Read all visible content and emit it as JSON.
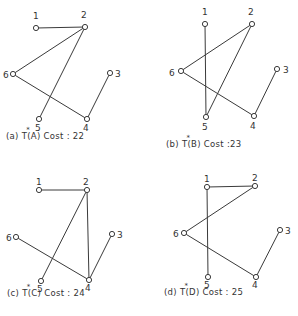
{
  "figure": {
    "panels": [
      {
        "id": "a",
        "caption": {
          "prefix": "(a)  T",
          "star": "*",
          "suffix": "(A)  Cost : 22",
          "x": 6,
          "y": 139,
          "tx": 36,
          "sx": 36
        },
        "nodes": [
          {
            "id": "1",
            "x": 36,
            "y": 28,
            "lx": 33,
            "ly": 19
          },
          {
            "id": "2",
            "x": 85,
            "y": 27,
            "lx": 81,
            "ly": 18
          },
          {
            "id": "3",
            "x": 110,
            "y": 73,
            "lx": 115,
            "ly": 77
          },
          {
            "id": "4",
            "x": 87,
            "y": 119,
            "lx": 83,
            "ly": 131
          },
          {
            "id": "5",
            "x": 39,
            "y": 119,
            "lx": 35,
            "ly": 131
          },
          {
            "id": "6",
            "x": 13,
            "y": 74,
            "lx": 3,
            "ly": 78
          }
        ],
        "edges": [
          [
            "1",
            "2"
          ],
          [
            "2",
            "6"
          ],
          [
            "2",
            "5"
          ],
          [
            "6",
            "4"
          ],
          [
            "4",
            "3"
          ]
        ]
      },
      {
        "id": "b",
        "caption": {
          "prefix": "(b)  T",
          "star": "*",
          "suffix": "(B)  Cost :23",
          "x": 166,
          "y": 147,
          "tx": 200,
          "sx": 200
        },
        "nodes": [
          {
            "id": "1",
            "x": 205,
            "y": 24,
            "lx": 202,
            "ly": 15
          },
          {
            "id": "2",
            "x": 252,
            "y": 24,
            "lx": 248,
            "ly": 15
          },
          {
            "id": "3",
            "x": 277,
            "y": 69,
            "lx": 283,
            "ly": 73
          },
          {
            "id": "4",
            "x": 254,
            "y": 116,
            "lx": 250,
            "ly": 129
          },
          {
            "id": "5",
            "x": 206,
            "y": 117,
            "lx": 202,
            "ly": 130
          },
          {
            "id": "6",
            "x": 181,
            "y": 71,
            "lx": 169,
            "ly": 76
          }
        ],
        "edges": [
          [
            "1",
            "5"
          ],
          [
            "2",
            "6"
          ],
          [
            "2",
            "5"
          ],
          [
            "6",
            "4"
          ],
          [
            "4",
            "3"
          ]
        ]
      },
      {
        "id": "c",
        "caption": {
          "prefix": "(c)  T",
          "star": "*",
          "suffix": "(C)  Cost : 24",
          "x": 7,
          "y": 296,
          "tx": 37,
          "sx": 37
        },
        "nodes": [
          {
            "id": "1",
            "x": 39,
            "y": 190,
            "lx": 36,
            "ly": 185
          },
          {
            "id": "2",
            "x": 87,
            "y": 190,
            "lx": 83,
            "ly": 185
          },
          {
            "id": "3",
            "x": 112,
            "y": 234,
            "lx": 117,
            "ly": 238
          },
          {
            "id": "4",
            "x": 89,
            "y": 280,
            "lx": 85,
            "ly": 291
          },
          {
            "id": "5",
            "x": 41,
            "y": 281,
            "lx": 37,
            "ly": 292
          },
          {
            "id": "6",
            "x": 16,
            "y": 237,
            "lx": 6,
            "ly": 241
          }
        ],
        "edges": [
          [
            "1",
            "2"
          ],
          [
            "2",
            "5"
          ],
          [
            "2",
            "4"
          ],
          [
            "6",
            "4"
          ],
          [
            "4",
            "3"
          ]
        ]
      },
      {
        "id": "d",
        "caption": {
          "prefix": "(d)  T",
          "star": "*",
          "suffix": "(D)  Cost : 25",
          "x": 164,
          "y": 295,
          "tx": 198,
          "sx": 198
        },
        "nodes": [
          {
            "id": "1",
            "x": 207,
            "y": 187,
            "lx": 204,
            "ly": 182
          },
          {
            "id": "2",
            "x": 255,
            "y": 186,
            "lx": 252,
            "ly": 181
          },
          {
            "id": "3",
            "x": 280,
            "y": 230,
            "lx": 285,
            "ly": 234
          },
          {
            "id": "4",
            "x": 256,
            "y": 277,
            "lx": 252,
            "ly": 288
          },
          {
            "id": "5",
            "x": 208,
            "y": 277,
            "lx": 204,
            "ly": 288
          },
          {
            "id": "6",
            "x": 184,
            "y": 233,
            "lx": 173,
            "ly": 237
          }
        ],
        "edges": [
          [
            "1",
            "2"
          ],
          [
            "1",
            "5"
          ],
          [
            "2",
            "6"
          ],
          [
            "6",
            "4"
          ],
          [
            "4",
            "3"
          ]
        ]
      }
    ]
  }
}
